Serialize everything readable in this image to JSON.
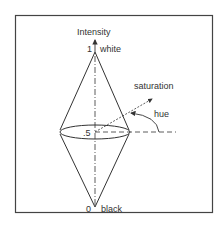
{
  "diagram": {
    "axis_label": "Intensity",
    "labels": {
      "top_value": "1",
      "top_name": "white",
      "mid_value": ".5",
      "bottom_value": "0",
      "bottom_name": "black",
      "saturation": "saturation",
      "hue": "hue"
    },
    "colors": {
      "line": "#333333",
      "background": "#ffffff",
      "frame": "#444444"
    }
  }
}
